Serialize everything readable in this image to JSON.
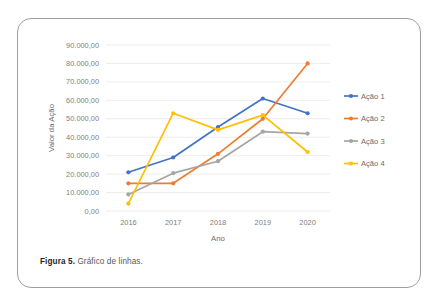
{
  "figure": {
    "caption_label": "Figura 5.",
    "caption_text": "Gráfico de linhas."
  },
  "chart_data": {
    "type": "line",
    "title": "",
    "xlabel": "Ano",
    "ylabel": "Valor da Ação",
    "categories": [
      "2016",
      "2017",
      "2018",
      "2019",
      "2020"
    ],
    "ytick_labels": [
      "0,00",
      "10.000,00",
      "20.000,00",
      "30.000,00",
      "40.000,00",
      "50.000,00",
      "60.000,00",
      "70.000,00",
      "80.000,00",
      "90.000,00"
    ],
    "ytick_values": [
      0,
      10000,
      20000,
      30000,
      40000,
      50000,
      60000,
      70000,
      80000,
      90000
    ],
    "ylim": [
      0,
      90000
    ],
    "grid": true,
    "legend_position": "right",
    "series": [
      {
        "name": "Ação 1",
        "color": "#4472c4",
        "values": [
          21000,
          29000,
          45500,
          61000,
          53000
        ]
      },
      {
        "name": "Ação 2",
        "color": "#ed7d31",
        "values": [
          15000,
          15000,
          31000,
          50000,
          80000
        ]
      },
      {
        "name": "Ação 3",
        "color": "#a5a5a5",
        "values": [
          9000,
          20500,
          27000,
          43000,
          42000
        ]
      },
      {
        "name": "Ação 4",
        "color": "#ffc000",
        "values": [
          4000,
          53000,
          44000,
          52000,
          32000
        ]
      }
    ]
  }
}
